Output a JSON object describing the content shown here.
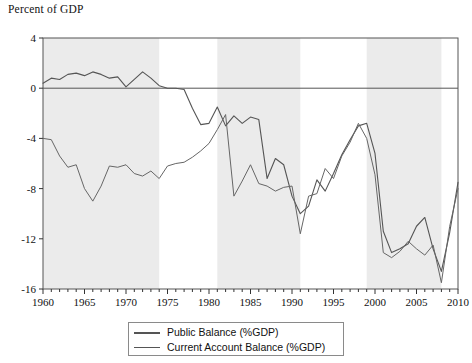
{
  "chart_data": {
    "type": "line",
    "title": "Percent of GDP",
    "xlabel": "",
    "ylabel": "Percent of GDP",
    "xlim": [
      1960,
      2010
    ],
    "ylim": [
      -16,
      4
    ],
    "yticks": [
      4,
      0,
      -4,
      -8,
      -12,
      -16
    ],
    "ytick_labels": [
      "4",
      "0",
      "-4",
      "-8",
      "-12",
      "-16"
    ],
    "xticks": [
      1960,
      1965,
      1970,
      1975,
      1980,
      1985,
      1990,
      1995,
      2000,
      2005,
      2010
    ],
    "xtick_labels": [
      "1960",
      "1965",
      "1970",
      "1975",
      "1980",
      "1985",
      "1990",
      "1995",
      "2000",
      "2005",
      "2010"
    ],
    "minor_xtick_interval": 1,
    "grid": false,
    "zero_line": true,
    "legend_position": "below-center",
    "shaded_bands": [
      {
        "start": 1960,
        "end": 1974
      },
      {
        "start": 1981,
        "end": 1991
      },
      {
        "start": 1999,
        "end": 2008
      }
    ],
    "shade_color": "#ebebeb",
    "x": [
      1960,
      1961,
      1962,
      1963,
      1964,
      1965,
      1966,
      1967,
      1968,
      1969,
      1970,
      1971,
      1972,
      1973,
      1974,
      1975,
      1976,
      1977,
      1978,
      1979,
      1980,
      1981,
      1982,
      1983,
      1984,
      1985,
      1986,
      1987,
      1988,
      1989,
      1990,
      1991,
      1992,
      1993,
      1994,
      1995,
      1996,
      1997,
      1998,
      1999,
      2000,
      2001,
      2002,
      2003,
      2004,
      2005,
      2006,
      2007,
      2008,
      2009,
      2010
    ],
    "series": [
      {
        "name": "Public Balance (%GDP)",
        "color": "#555555",
        "width": 1.1,
        "values": [
          0.4,
          0.8,
          0.7,
          1.1,
          1.2,
          1.0,
          1.3,
          1.1,
          0.8,
          0.9,
          0.1,
          0.7,
          1.3,
          0.8,
          0.2,
          0.0,
          0.0,
          -0.1,
          -1.6,
          -2.9,
          -2.8,
          -1.5,
          -3.0,
          -2.2,
          -2.8,
          -2.3,
          -2.5,
          -7.2,
          -5.6,
          -6.1,
          -8.6,
          -10.0,
          -9.4,
          -7.3,
          -8.2,
          -6.8,
          -5.3,
          -4.1,
          -3.0,
          -2.8,
          -5.2,
          -11.4,
          -13.1,
          -12.8,
          -12.4,
          -11.0,
          -10.3,
          -12.8,
          -14.6,
          -11.5,
          -7.5
        ]
      },
      {
        "name": "Current Account Balance (%GDP)",
        "color": "#666666",
        "width": 1.0,
        "values": [
          -4.0,
          -4.1,
          -5.4,
          -6.3,
          -6.1,
          -8.0,
          -9.0,
          -7.8,
          -6.2,
          -6.3,
          -6.1,
          -6.8,
          -7.0,
          -6.6,
          -7.2,
          -6.2,
          -6.0,
          -5.9,
          -5.5,
          -5.0,
          -4.4,
          -3.3,
          -2.1,
          -8.6,
          -7.4,
          -6.1,
          -7.6,
          -7.8,
          -8.2,
          -7.9,
          -7.8,
          -11.6,
          -8.6,
          -8.4,
          -6.4,
          -7.2,
          -5.4,
          -4.3,
          -2.8,
          -4.0,
          -6.9,
          -13.1,
          -13.5,
          -13.0,
          -12.2,
          -12.8,
          -13.3,
          -12.5,
          -15.5,
          -11.0,
          -8.0
        ]
      }
    ]
  },
  "legend": {
    "items": [
      {
        "label": "Public Balance (%GDP)"
      },
      {
        "label": "Current Account Balance (%GDP)"
      }
    ]
  }
}
